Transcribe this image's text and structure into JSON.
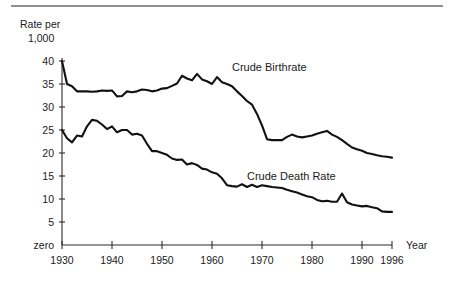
{
  "figure": {
    "top_rule_color": "#8f8f8f",
    "background": "#ffffff"
  },
  "chart_data": {
    "type": "line",
    "title": "",
    "xlabel": "Year",
    "ylabel": "Rate per 1,000",
    "ylabel_line1": "Rate per",
    "ylabel_line2": "1,000",
    "grid": false,
    "legend": "inline-annotations",
    "xlim": [
      1930,
      1996
    ],
    "ylim": [
      0,
      40
    ],
    "xticks": [
      1930,
      1940,
      1950,
      1960,
      1970,
      1980,
      1990,
      1996
    ],
    "xticklabels": [
      "1930",
      "1940",
      "1950",
      "1960",
      "1970",
      "1980",
      "1990",
      "1996"
    ],
    "yticks": [
      0,
      5,
      10,
      15,
      20,
      25,
      30,
      35,
      40
    ],
    "yticklabels": [
      "zero",
      "5",
      "10",
      "15",
      "20",
      "25",
      "30",
      "35",
      "40"
    ],
    "line_color": "#111111",
    "series": [
      {
        "name": "Crude Birthrate",
        "label_x": 1996,
        "x": [
          1930,
          1931,
          1932,
          1933,
          1934,
          1935,
          1936,
          1937,
          1938,
          1939,
          1940,
          1941,
          1942,
          1943,
          1944,
          1945,
          1946,
          1947,
          1948,
          1949,
          1950,
          1951,
          1952,
          1953,
          1954,
          1955,
          1956,
          1957,
          1958,
          1959,
          1960,
          1961,
          1962,
          1963,
          1964,
          1965,
          1966,
          1967,
          1968,
          1969,
          1970,
          1971,
          1972,
          1973,
          1974,
          1975,
          1976,
          1977,
          1978,
          1979,
          1980,
          1981,
          1982,
          1983,
          1984,
          1985,
          1986,
          1987,
          1988,
          1989,
          1990,
          1991,
          1992,
          1993,
          1994,
          1995,
          1996
        ],
        "values": [
          40.0,
          35.0,
          34.5,
          33.4,
          33.4,
          33.4,
          33.3,
          33.4,
          33.6,
          33.5,
          33.6,
          32.3,
          32.4,
          33.4,
          33.2,
          33.4,
          33.8,
          33.7,
          33.4,
          33.6,
          34.0,
          34.1,
          34.6,
          35.1,
          36.8,
          36.2,
          35.8,
          37.2,
          36.0,
          35.6,
          35.0,
          36.5,
          35.4,
          35.0,
          34.5,
          33.4,
          32.4,
          31.3,
          30.5,
          28.5,
          26.0,
          23.0,
          22.8,
          22.8,
          22.8,
          23.5,
          24.0,
          23.6,
          23.4,
          23.6,
          23.8,
          24.2,
          24.5,
          24.8,
          24.0,
          23.5,
          22.8,
          22.0,
          21.2,
          20.8,
          20.5,
          20.0,
          19.8,
          19.5,
          19.3,
          19.2,
          19.0
        ],
        "start_value": 40.0,
        "end_value": 19.0
      },
      {
        "name": "Crude Death Rate",
        "label_x": 1996,
        "x": [
          1930,
          1931,
          1932,
          1933,
          1934,
          1935,
          1936,
          1937,
          1938,
          1939,
          1940,
          1941,
          1942,
          1943,
          1944,
          1945,
          1946,
          1947,
          1948,
          1949,
          1950,
          1951,
          1952,
          1953,
          1954,
          1955,
          1956,
          1957,
          1958,
          1959,
          1960,
          1961,
          1962,
          1963,
          1964,
          1965,
          1966,
          1967,
          1968,
          1969,
          1970,
          1971,
          1972,
          1973,
          1974,
          1975,
          1976,
          1977,
          1978,
          1979,
          1980,
          1981,
          1982,
          1983,
          1984,
          1985,
          1986,
          1987,
          1988,
          1989,
          1990,
          1991,
          1992,
          1993,
          1994,
          1995,
          1996
        ],
        "values": [
          25.0,
          23.2,
          22.3,
          23.8,
          23.6,
          25.8,
          27.2,
          27.0,
          26.2,
          25.2,
          25.8,
          24.5,
          25.0,
          25.0,
          24.0,
          24.2,
          23.8,
          22.0,
          20.4,
          20.4,
          20.0,
          19.6,
          18.8,
          18.5,
          18.6,
          17.5,
          17.8,
          17.4,
          16.6,
          16.4,
          15.8,
          15.5,
          14.5,
          13.0,
          12.8,
          12.7,
          13.2,
          12.6,
          13.1,
          12.6,
          13.0,
          12.8,
          12.6,
          12.5,
          12.4,
          12.0,
          11.7,
          11.4,
          11.0,
          10.6,
          10.4,
          9.8,
          9.5,
          9.6,
          9.4,
          9.4,
          11.2,
          9.3,
          8.8,
          8.6,
          8.4,
          8.5,
          8.2,
          8.0,
          7.3,
          7.2,
          7.2
        ],
        "start_value": 25.0,
        "end_value": 7.2
      }
    ]
  },
  "annotations": {
    "birthrate_label": "Crude Birthrate",
    "deathrate_label": "Crude Death Rate",
    "year_axis_label": "Year"
  }
}
